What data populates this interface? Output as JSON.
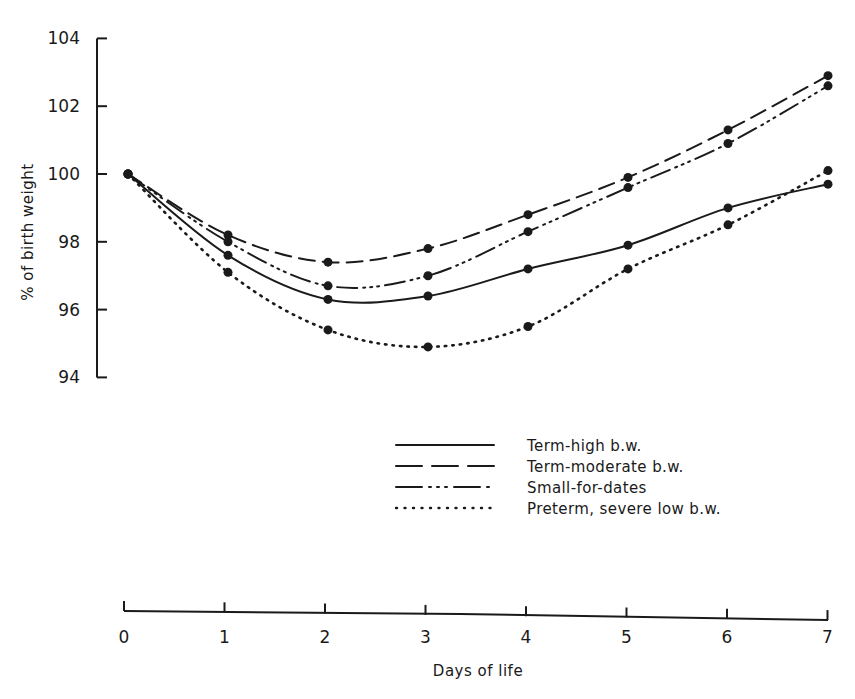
{
  "chart_data": {
    "type": "line",
    "title": "",
    "xlabel": "Days of life",
    "ylabel": "% of birth weight",
    "x": [
      0,
      1,
      2,
      3,
      4,
      5,
      6,
      7
    ],
    "xticks": [
      "0",
      "1",
      "2",
      "3",
      "4",
      "5",
      "6",
      "7"
    ],
    "yticks": [
      "94",
      "96",
      "98",
      "100",
      "102",
      "104"
    ],
    "ylim": [
      94,
      104
    ],
    "xlim": [
      0,
      7
    ],
    "grid": false,
    "legend_position": "lower-right, below plot",
    "series": [
      {
        "name": "Term-high b.w.",
        "style": "solid",
        "values": [
          100.0,
          97.6,
          96.3,
          96.4,
          97.2,
          97.9,
          99.0,
          99.7
        ]
      },
      {
        "name": "Term-moderate b.w.",
        "style": "dashed",
        "values": [
          100.0,
          98.2,
          97.4,
          97.8,
          98.8,
          99.9,
          101.3,
          102.9
        ]
      },
      {
        "name": "Small-for-dates",
        "style": "dash-dot-dot",
        "values": [
          100.0,
          98.0,
          96.7,
          97.0,
          98.3,
          99.6,
          100.9,
          102.6
        ]
      },
      {
        "name": "Preterm, severe low b.w.",
        "style": "dotted",
        "values": [
          100.0,
          97.1,
          95.4,
          94.9,
          95.5,
          97.2,
          98.5,
          100.1
        ]
      }
    ]
  }
}
